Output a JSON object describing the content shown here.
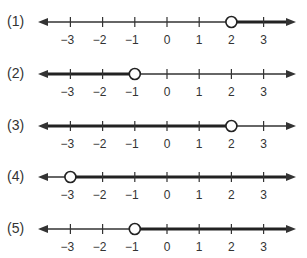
{
  "options": [
    {
      "label": "(1)",
      "boundary": 2,
      "open": true,
      "direction": "right"
    },
    {
      "label": "(2)",
      "boundary": -1,
      "open": true,
      "direction": "left"
    },
    {
      "label": "(3)",
      "boundary": 2,
      "open": true,
      "direction": "left"
    },
    {
      "label": "(4)",
      "boundary": -3,
      "open": true,
      "direction": "right"
    },
    {
      "label": "(5)",
      "boundary": -1,
      "open": true,
      "direction": "right"
    }
  ],
  "ticks": [
    "−3",
    "−2",
    "−1",
    "0",
    "1",
    "2",
    "3"
  ],
  "tick_values": [
    -3,
    -2,
    -1,
    0,
    1,
    2,
    3
  ],
  "colors": {
    "line": "#333333",
    "shade": "#222222",
    "circle_fill": "#ffffff"
  }
}
